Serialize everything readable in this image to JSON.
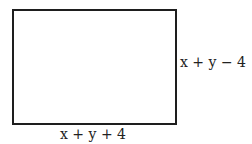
{
  "diagram": {
    "shape": "rectangle",
    "labels": {
      "right_side": "x + y − 4",
      "bottom_side": "x + y + 4"
    }
  }
}
